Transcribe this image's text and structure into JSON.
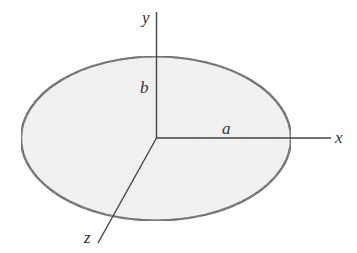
{
  "diagram": {
    "axes": {
      "x": {
        "label": "x"
      },
      "y": {
        "label": "y"
      },
      "z": {
        "label": "z"
      }
    },
    "semi_axes": {
      "a": {
        "label": "a"
      },
      "b": {
        "label": "b"
      }
    },
    "colors": {
      "fill": "#efefef",
      "stroke": "#333333",
      "axis": "#444444",
      "text": "#333333"
    }
  }
}
